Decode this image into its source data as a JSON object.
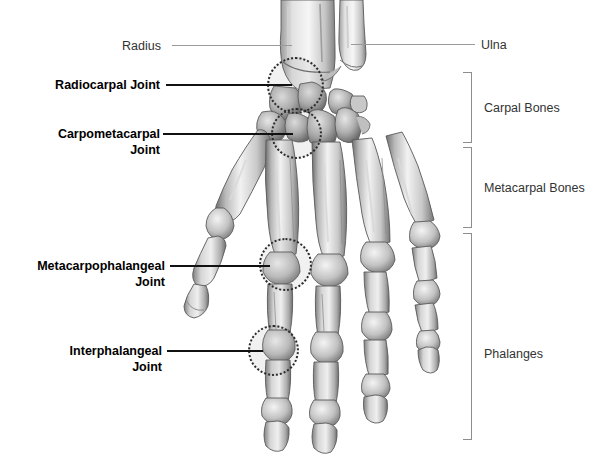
{
  "figure": {
    "width": 598,
    "height": 470,
    "background_color": "#ffffff"
  },
  "labels": {
    "radius": "Radius",
    "ulna": "Ulna",
    "radiocarpal_joint": "Radiocarpal Joint",
    "carpometacarpal_joint": "Carpometacarpal\nJoint",
    "metacarpophalangeal_joint": "Metacarpophalangeal\nJoint",
    "interphalangeal_joint": "Interphalangeal\nJoint"
  },
  "brackets": [
    {
      "label": "Carpal Bones"
    },
    {
      "label": "Metacarpal Bones"
    },
    {
      "label": "Phalanges"
    }
  ],
  "colors": {
    "leader_line": "#111111",
    "thin_leader_line": "#9a9a9a",
    "bracket": "#8d8d8d",
    "highlight_circle": "#2b2b2b",
    "bold_text": "#000000",
    "plain_text": "#333333"
  }
}
